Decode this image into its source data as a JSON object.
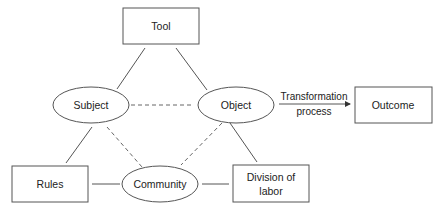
{
  "diagram": {
    "type": "activity-system-triangle",
    "colors": {
      "stroke": "#555555",
      "text": "#222222",
      "background": "#ffffff"
    },
    "nodes": {
      "tool": {
        "label": "Tool",
        "shape": "rectangle"
      },
      "subject": {
        "label": "Subject",
        "shape": "ellipse"
      },
      "object": {
        "label": "Object",
        "shape": "ellipse"
      },
      "outcome": {
        "label": "Outcome",
        "shape": "rectangle"
      },
      "rules": {
        "label": "Rules",
        "shape": "rectangle"
      },
      "community": {
        "label": "Community",
        "shape": "ellipse"
      },
      "division": {
        "label_line1": "Division of",
        "label_line2": "labor",
        "shape": "rectangle"
      }
    },
    "edges": [
      {
        "from": "tool",
        "to": "subject",
        "style": "solid"
      },
      {
        "from": "tool",
        "to": "object",
        "style": "solid"
      },
      {
        "from": "subject",
        "to": "object",
        "style": "dashed"
      },
      {
        "from": "subject",
        "to": "rules",
        "style": "solid"
      },
      {
        "from": "subject",
        "to": "community",
        "style": "dashed"
      },
      {
        "from": "object",
        "to": "community",
        "style": "dashed"
      },
      {
        "from": "object",
        "to": "division",
        "style": "solid"
      },
      {
        "from": "rules",
        "to": "community",
        "style": "solid"
      },
      {
        "from": "community",
        "to": "division",
        "style": "solid"
      },
      {
        "from": "object",
        "to": "outcome",
        "style": "arrow",
        "label_line1": "Transformation",
        "label_line2": "process"
      }
    ]
  }
}
